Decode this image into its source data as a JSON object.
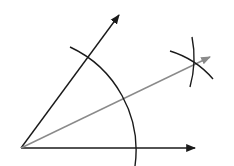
{
  "diagram": {
    "vertex": {
      "x": 21,
      "y": 148
    },
    "rays": [
      {
        "name": "horizontal-ray",
        "x2": 196,
        "y2": 148,
        "color": "#1a1a1a"
      },
      {
        "name": "upper-ray",
        "x2": 120,
        "y2": 14,
        "color": "#1a1a1a"
      },
      {
        "name": "bisector-ray",
        "x2": 211,
        "y2": 56,
        "color": "#8a8a8a"
      }
    ],
    "arcs": {
      "main_arc": {
        "radius": 114,
        "color": "#1a1a1a"
      },
      "construction_arcs_intersection": {
        "x": 193,
        "y": 63
      }
    }
  }
}
